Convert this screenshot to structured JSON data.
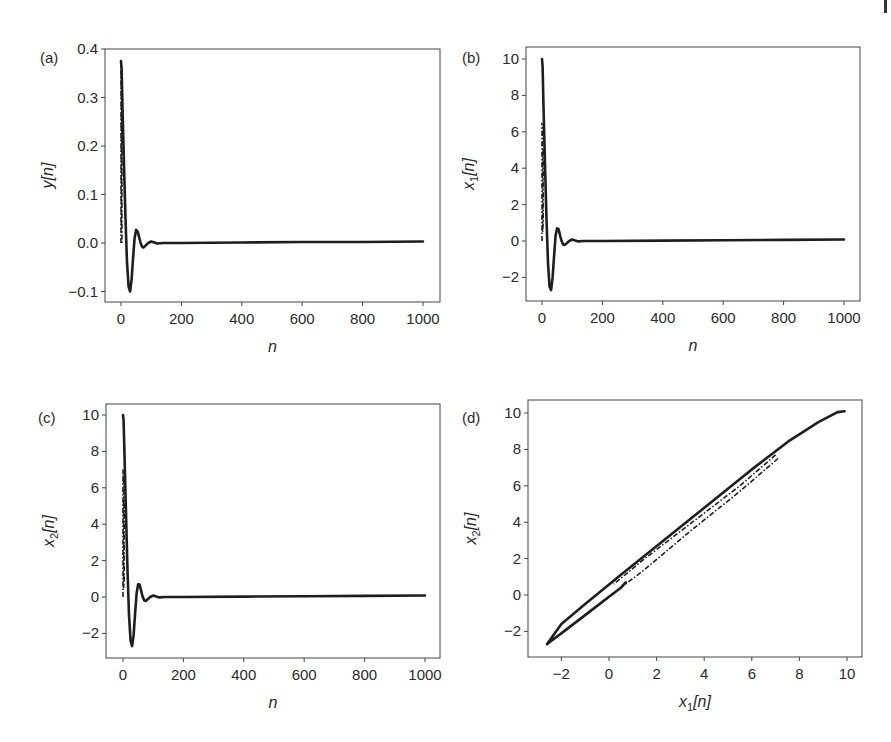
{
  "figure": {
    "page_edge_marker": "|"
  },
  "chart_data": [
    {
      "id": "a",
      "type": "line",
      "panel_label": "(a)",
      "title": "",
      "xlabel": "n",
      "ylabel": "y[n]",
      "xlim": [
        -50,
        1050
      ],
      "ylim": [
        -0.125,
        0.42
      ],
      "xticks": [
        0,
        200,
        400,
        600,
        800,
        1000
      ],
      "xtick_labels": [
        "0",
        "200",
        "400",
        "600",
        "800",
        "1000"
      ],
      "yticks": [
        -0.1,
        0.0,
        0.1,
        0.2,
        0.3,
        0.4
      ],
      "ytick_labels": [
        "−0.1",
        "0.0",
        "0.1",
        "0.2",
        "0.3",
        "0.4"
      ],
      "grid": false,
      "legend": null,
      "series": [
        {
          "name": "response (solid)",
          "style": "solid",
          "x": [
            0,
            2,
            5,
            10,
            15,
            20,
            25,
            30,
            35,
            40,
            45,
            50,
            55,
            60,
            65,
            70,
            75,
            80,
            90,
            100,
            110,
            120,
            140,
            200,
            400,
            600,
            800,
            1000
          ],
          "y": [
            0.375,
            0.36,
            0.28,
            0.16,
            0.05,
            -0.04,
            -0.09,
            -0.1,
            -0.075,
            -0.03,
            0.01,
            0.027,
            0.024,
            0.012,
            0.0,
            -0.008,
            -0.009,
            -0.006,
            0.0,
            0.003,
            0.001,
            -0.001,
            0.0,
            0.0,
            0.001,
            0.002,
            0.002,
            0.003
          ]
        },
        {
          "name": "transient (dash-dot)",
          "style": "dashdot",
          "x": [
            0,
            0,
            1,
            1,
            2,
            2,
            3,
            3
          ],
          "y": [
            0.0,
            0.37,
            0.36,
            0.02,
            0.03,
            0.33,
            0.3,
            0.0
          ]
        }
      ]
    },
    {
      "id": "b",
      "type": "line",
      "panel_label": "(b)",
      "title": "",
      "xlabel": "n",
      "ylabel": "x₁[n]",
      "ylabel_main": "x",
      "ylabel_sub": "1",
      "ylabel_tail": "[n]",
      "xlim": [
        -50,
        1050
      ],
      "ylim": [
        -3.3,
        10.6
      ],
      "xticks": [
        0,
        200,
        400,
        600,
        800,
        1000
      ],
      "xtick_labels": [
        "0",
        "200",
        "400",
        "600",
        "800",
        "1000"
      ],
      "yticks": [
        -2,
        0,
        2,
        4,
        6,
        8,
        10
      ],
      "ytick_labels": [
        "−2",
        "0",
        "2",
        "4",
        "6",
        "8",
        "10"
      ],
      "grid": false,
      "legend": null,
      "series": [
        {
          "name": "x1 (solid)",
          "style": "solid",
          "x": [
            0,
            2,
            5,
            10,
            15,
            20,
            25,
            30,
            35,
            40,
            45,
            50,
            55,
            60,
            65,
            70,
            75,
            80,
            90,
            100,
            110,
            120,
            140,
            200,
            400,
            600,
            800,
            1000
          ],
          "y": [
            10.0,
            9.6,
            7.4,
            4.2,
            1.2,
            -1.2,
            -2.5,
            -2.7,
            -2.0,
            -0.8,
            0.3,
            0.7,
            0.65,
            0.3,
            0.0,
            -0.2,
            -0.22,
            -0.15,
            0.0,
            0.08,
            0.03,
            -0.02,
            0.0,
            0.0,
            0.02,
            0.04,
            0.06,
            0.08
          ]
        },
        {
          "name": "transient (dash-dot)",
          "style": "dashdot",
          "x": [
            0,
            0,
            2,
            2,
            4,
            4
          ],
          "y": [
            0.0,
            6.5,
            6.0,
            0.5,
            1.0,
            5.0
          ]
        }
      ]
    },
    {
      "id": "c",
      "type": "line",
      "panel_label": "(c)",
      "title": "",
      "xlabel": "n",
      "ylabel": "x₂[n]",
      "ylabel_main": "x",
      "ylabel_sub": "2",
      "ylabel_tail": "[n]",
      "xlim": [
        -50,
        1050
      ],
      "ylim": [
        -3.3,
        10.6
      ],
      "xticks": [
        0,
        200,
        400,
        600,
        800,
        1000
      ],
      "xtick_labels": [
        "0",
        "200",
        "400",
        "600",
        "800",
        "1000"
      ],
      "yticks": [
        -2,
        0,
        2,
        4,
        6,
        8,
        10
      ],
      "ytick_labels": [
        "−2",
        "0",
        "2",
        "4",
        "6",
        "8",
        "10"
      ],
      "grid": false,
      "legend": null,
      "series": [
        {
          "name": "x2 (solid)",
          "style": "solid",
          "x": [
            0,
            2,
            5,
            10,
            15,
            20,
            25,
            30,
            35,
            40,
            45,
            50,
            55,
            60,
            65,
            70,
            75,
            80,
            90,
            100,
            110,
            120,
            140,
            200,
            400,
            600,
            800,
            1000
          ],
          "y": [
            10.0,
            9.7,
            7.8,
            4.6,
            1.5,
            -1.0,
            -2.4,
            -2.7,
            -2.1,
            -0.9,
            0.2,
            0.7,
            0.68,
            0.35,
            0.02,
            -0.18,
            -0.22,
            -0.15,
            0.0,
            0.08,
            0.03,
            -0.02,
            0.0,
            0.0,
            0.02,
            0.04,
            0.06,
            0.08
          ]
        },
        {
          "name": "transient (dash-dot)",
          "style": "dashdot",
          "x": [
            0,
            0,
            2,
            2,
            4,
            4
          ],
          "y": [
            0.0,
            7.0,
            6.5,
            0.5,
            1.0,
            5.5
          ]
        }
      ]
    },
    {
      "id": "d",
      "type": "line",
      "panel_label": "(d)",
      "title": "",
      "xlabel": "x₁[n]",
      "xlabel_main": "x",
      "xlabel_sub": "1",
      "xlabel_tail": "[n]",
      "ylabel": "x₂[n]",
      "ylabel_main": "x",
      "ylabel_sub": "2",
      "ylabel_tail": "[n]",
      "xlim": [
        -3.4,
        10.6
      ],
      "ylim": [
        -3.3,
        10.6
      ],
      "xticks": [
        -2,
        0,
        2,
        4,
        6,
        8,
        10
      ],
      "xtick_labels": [
        "−2",
        "0",
        "2",
        "4",
        "6",
        "8",
        "10"
      ],
      "yticks": [
        -2,
        0,
        2,
        4,
        6,
        8,
        10
      ],
      "ytick_labels": [
        "−2",
        "0",
        "2",
        "4",
        "6",
        "8",
        "10"
      ],
      "grid": false,
      "legend": null,
      "series": [
        {
          "name": "phase trajectory (solid)",
          "style": "solid",
          "x": [
            9.9,
            9.6,
            8.8,
            7.6,
            6.0,
            4.2,
            2.2,
            0.4,
            -1.0,
            -2.0,
            -2.6,
            -2.5,
            -1.8,
            -0.8,
            0.0,
            0.5,
            0.7
          ],
          "y": [
            10.1,
            10.05,
            9.5,
            8.5,
            6.9,
            5.0,
            2.9,
            1.0,
            -0.5,
            -1.6,
            -2.7,
            -2.6,
            -1.9,
            -0.9,
            -0.1,
            0.4,
            0.7
          ]
        },
        {
          "name": "transient (dash-dot)",
          "style": "dashdot",
          "x": [
            7.1,
            5.5,
            3.5,
            1.5,
            0.0,
            -0.2
          ],
          "y": [
            7.5,
            5.7,
            3.6,
            1.4,
            -0.1,
            -0.3
          ]
        },
        {
          "name": "transient (dash-dot) 2",
          "style": "dashdot",
          "x": [
            7.0,
            5.5,
            3.5,
            1.5,
            0.2
          ],
          "y": [
            7.7,
            6.0,
            4.0,
            2.0,
            0.6
          ]
        }
      ]
    }
  ]
}
